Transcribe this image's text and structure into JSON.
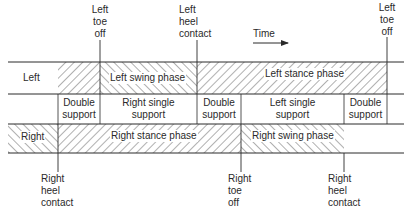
{
  "events_top": [
    {
      "id": "left-toe-off-1",
      "lines": [
        "Left",
        "toe",
        "off"
      ]
    },
    {
      "id": "left-heel-contact",
      "lines": [
        "Left",
        "heel",
        "contact"
      ]
    },
    {
      "id": "left-toe-off-2",
      "lines": [
        "Left",
        "toe",
        "off"
      ]
    }
  ],
  "events_bottom": [
    {
      "id": "right-heel-contact-1",
      "lines": [
        "Right",
        "heel",
        "contact"
      ]
    },
    {
      "id": "right-toe-off",
      "lines": [
        "Right",
        "toe",
        "off"
      ]
    },
    {
      "id": "right-heel-contact-2",
      "lines": [
        "Right",
        "heel",
        "contact"
      ]
    }
  ],
  "time_label": "Time",
  "rows": {
    "left": {
      "label": "Left",
      "swing": "Left swing phase",
      "stance": "Left stance phase"
    },
    "support": [
      {
        "lines": [
          "Double",
          "support"
        ]
      },
      {
        "lines": [
          "Right single",
          "support"
        ]
      },
      {
        "lines": [
          "Double",
          "support"
        ]
      },
      {
        "lines": [
          "Left single",
          "support"
        ]
      },
      {
        "lines": [
          "Double",
          "support"
        ]
      }
    ],
    "right": {
      "label": "Right",
      "stance": "Right stance phase",
      "swing": "Right swing phase"
    }
  },
  "colors": {
    "line": "#2a2a2a",
    "hatch": "#3a3a3a",
    "background": "#ffffff"
  }
}
